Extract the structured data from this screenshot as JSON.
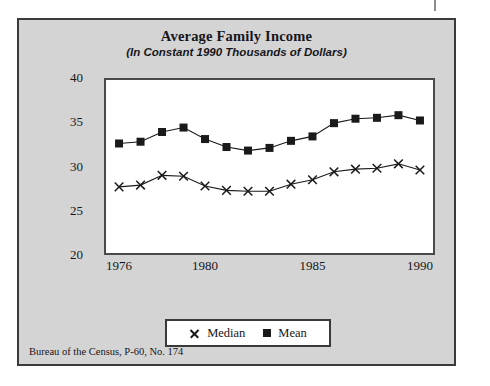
{
  "figure": {
    "title": "Average Family Income",
    "subtitle": "(In Constant 1990 Thousands of Dollars)",
    "source_note": "Bureau of the Census, P-60, No. 174",
    "panel_background": "#d4d4d4",
    "frame_color": "#3a3a3a",
    "plot_background": "#ffffff",
    "series_color": "#1a1a1a"
  },
  "chart_data": {
    "type": "line",
    "title": "Average Family Income",
    "subtitle": "(In Constant 1990 Thousands of Dollars)",
    "xlabel": "",
    "ylabel": "",
    "xlim": [
      1975.3,
      1990.7
    ],
    "ylim": [
      20,
      40
    ],
    "yticks": [
      20,
      25,
      30,
      35,
      40
    ],
    "ytick_labels": [
      "20",
      "25",
      "30",
      "35",
      "40"
    ],
    "xticks": [
      1976,
      1980,
      1985,
      1990
    ],
    "xtick_labels": [
      "1976",
      "1980",
      "1985",
      "1990"
    ],
    "grid": false,
    "legend_position": "below-plot",
    "x": [
      1976,
      1977,
      1978,
      1979,
      1980,
      1981,
      1982,
      1983,
      1984,
      1985,
      1986,
      1987,
      1988,
      1989,
      1990
    ],
    "series": [
      {
        "name": "Median",
        "marker": "x",
        "values": [
          27.7,
          27.9,
          29.0,
          28.9,
          27.8,
          27.3,
          27.2,
          27.2,
          28.0,
          28.5,
          29.4,
          29.7,
          29.8,
          30.3,
          29.6
        ]
      },
      {
        "name": "Mean",
        "marker": "square",
        "values": [
          32.6,
          32.8,
          33.9,
          34.4,
          33.1,
          32.2,
          31.8,
          32.1,
          32.9,
          33.4,
          34.9,
          35.4,
          35.5,
          35.8,
          35.2
        ]
      }
    ]
  },
  "legend": {
    "entries": [
      {
        "label": "Median",
        "marker": "x"
      },
      {
        "label": "Mean",
        "marker": "square"
      }
    ]
  }
}
